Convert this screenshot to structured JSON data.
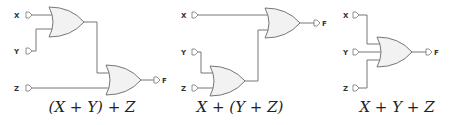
{
  "diagrams": [
    {
      "inputs": [
        "X",
        "Y",
        "Z"
      ],
      "output": "F",
      "caption": "(X + Y) + Z"
    },
    {
      "inputs": [
        "X",
        "Y",
        "Z"
      ],
      "output": "F",
      "caption": "X + (Y + Z)"
    },
    {
      "inputs": [
        "X",
        "Y",
        "Z"
      ],
      "output": "F",
      "caption": "X + Y + Z"
    }
  ],
  "colors": {
    "wire": "#777777",
    "gate_fill": "#f2f2f2",
    "label": "#333333"
  }
}
